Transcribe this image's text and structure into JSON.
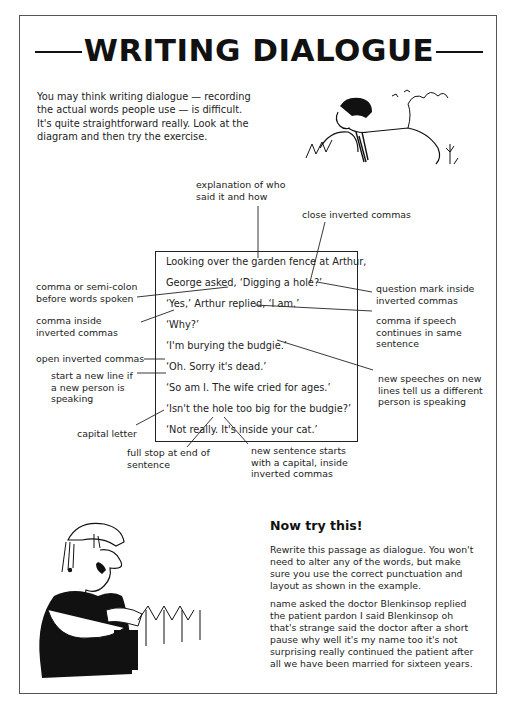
{
  "page": {
    "title": "WRITING DIALOGUE",
    "intro": "You may think writing dialogue — recording the actual words people use — is difficult. It's quite straightforward really. Look at the diagram and then try the exercise."
  },
  "diagram": {
    "lines": [
      "Looking over the garden fence at Arthur,",
      "George asked, ‘Digging a hole?’",
      "‘Yes,’ Arthur replied, ‘I am.’",
      "‘Why?’",
      "‘I'm burying the budgie.’",
      "‘Oh. Sorry it's dead.’",
      "‘So am I. The wife cried for ages.’",
      "‘Isn't the hole too big for the budgie?’",
      "‘Not really. It's inside your cat.’"
    ],
    "annotations": {
      "explanation": "explanation of who said it and how",
      "close_commas": "close inverted commas",
      "comma_semicolon": "comma or semi-colon before words spoken",
      "question_mark": "question mark inside inverted commas",
      "comma_inside": "comma inside inverted commas",
      "comma_speech": "comma if speech continues in same sentence",
      "open_commas": "open inverted commas",
      "new_line": "start a new line if a new person is speaking",
      "new_speeches": "new speeches on new lines tell us a different person is speaking",
      "capital_letter": "capital letter",
      "full_stop": "full stop at end of sentence",
      "new_sentence": "new sentence starts with a capital, inside inverted commas"
    }
  },
  "exercise": {
    "heading": "Now try this!",
    "instructions": "Rewrite this passage as dialogue. You won't need to alter any of the words, but make sure you use the correct punctuation and layout as shown in the example.",
    "passage": "name asked the doctor Blenkinsop replied the patient pardon I said Blenkinsop oh that's strange said the doctor after a short pause why well it's my name too it's not surprising really continued the patient after all we have been married for sixteen years."
  },
  "illustrations": {
    "top_right": "man-leaning-over-fence-cartoon",
    "bottom_left": "man-with-moustache-leaning-on-spade-cartoon"
  }
}
